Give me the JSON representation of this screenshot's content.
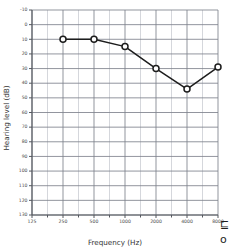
{
  "chart_data": {
    "type": "line",
    "title": "",
    "xlabel": "Frequency (Hz)",
    "ylabel": "Hearing level (dB)",
    "x_scale": "log2",
    "x_tick_labels": [
      "125",
      "250",
      "500",
      "1000",
      "2000",
      "4000",
      "8000"
    ],
    "x_tick_values": [
      125,
      250,
      500,
      1000,
      2000,
      4000,
      8000
    ],
    "xlim": [
      125,
      8000
    ],
    "y_tick_labels": [
      "-10",
      "0",
      "10",
      "20",
      "30",
      "40",
      "50",
      "60",
      "70",
      "80",
      "90",
      "100",
      "110",
      "120",
      "130"
    ],
    "y_tick_values": [
      -10,
      0,
      10,
      20,
      30,
      40,
      50,
      60,
      70,
      80,
      90,
      100,
      110,
      120,
      130
    ],
    "ylim": [
      -10,
      130
    ],
    "y_inverted": true,
    "grid": true,
    "grid_minor": true,
    "legend_position": "none",
    "series": [
      {
        "name": "Air conduction (right ear)",
        "marker": "circle-open",
        "color": "#1d1d1d",
        "x": [
          250,
          500,
          1000,
          2000,
          4000,
          8000
        ],
        "values": [
          10,
          10,
          15,
          30,
          44,
          29
        ]
      }
    ],
    "annotations": [
      "⊑",
      "o"
    ]
  },
  "axes": {
    "x_title": "Frequency (Hz)",
    "y_title": "Hearing level (dB)"
  },
  "legend_corner": {
    "glyph_top": "⊑",
    "glyph_bottom": "o"
  }
}
